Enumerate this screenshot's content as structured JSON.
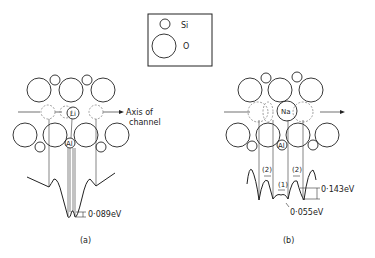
{
  "legend": {
    "items": [
      {
        "symbol": "small-circle",
        "label": "Si"
      },
      {
        "symbol": "large-circle",
        "label": "O"
      }
    ]
  },
  "panel_a": {
    "caption": "(a)",
    "axis_label_line1": "Axis of",
    "axis_label_line2": "channel",
    "ion_label": "Li",
    "site_label": "Al",
    "barrier_label": "0·089eV"
  },
  "panel_b": {
    "caption": "(b)",
    "ion_label": "Na",
    "site_label": "Al",
    "well_labels": [
      "(2)",
      "(1)",
      "(2)"
    ],
    "barrier_high_label": "0·143eV",
    "barrier_low_label": "0·055eV"
  }
}
